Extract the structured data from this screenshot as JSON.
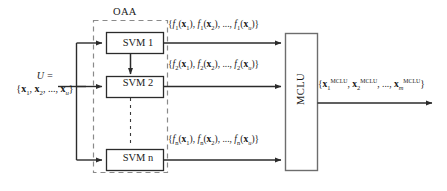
{
  "diagram": {
    "group_box": {
      "label": "OAA"
    },
    "input": {
      "name_line": "U =",
      "set_line": "{x1, x2, ..., xu}"
    },
    "classifiers": [
      {
        "label": "SVM 1",
        "output_set": "{f1(x1), f1(x2), ..., f1(xu)}"
      },
      {
        "label": "SVM 2",
        "output_set": "{f2(x1), f2(x2), ..., f2(xu)}"
      },
      {
        "label": "SVM n",
        "output_set": "{fn(x1), fn(x2), ..., fn(xu)}"
      }
    ],
    "selector": {
      "label": "MCLU"
    },
    "output": {
      "set": "{x1^MCLU, x2^MCLU, ..., xm^MCLU}"
    },
    "colors": {
      "background": "#ffffff",
      "stroke": "#2b2b2b",
      "dashed_stroke": "#8a8a8a",
      "text": "#1a1a1a"
    }
  }
}
